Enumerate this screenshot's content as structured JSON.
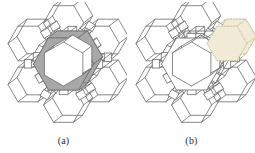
{
  "figure": {
    "type": "line-drawing",
    "background_color": "#ffffff",
    "stroke_color": "#6b6b6b",
    "stroke_color_dark": "#4a4a4a",
    "panels": [
      {
        "id": "a",
        "caption": "(a)",
        "highlight": {
          "name": "central-12-ring-channel",
          "fill_color": "#a8a8a8",
          "stroke_color": "#6e6e6e",
          "style": "solid-shaded"
        }
      },
      {
        "id": "b",
        "caption": "(b)",
        "highlight": {
          "name": "upper-right-hexagonal-prism-cage",
          "fill_color": "#f0ead6",
          "stroke_color": "#c9c0a0",
          "style": "dotted-outline"
        }
      }
    ]
  },
  "chart_data": {
    "type": "diagram",
    "title": "",
    "xlabel": "",
    "ylabel": "",
    "panel_labels": [
      "(a)",
      "(b)"
    ],
    "geometry": {
      "center": [
        63.5,
        62
      ],
      "central_ring_outer_radius": 30,
      "central_ring_inner_radius": 22,
      "cage_ring_radius": 41,
      "cage_count": 6,
      "cage_angles_deg": [
        90,
        150,
        210,
        270,
        330,
        30
      ],
      "cage_hex_radius": 20,
      "prism_depth": [
        9,
        -7
      ]
    },
    "series": [
      {
        "name": "central channel ring (a)",
        "values": [
          1
        ],
        "fill": "#a8a8a8"
      },
      {
        "name": "highlighted cage (b)",
        "values": [
          1
        ],
        "fill": "#f0ead6"
      }
    ]
  }
}
